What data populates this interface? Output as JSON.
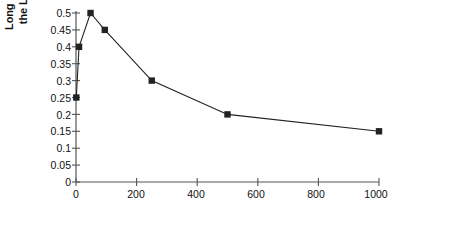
{
  "chart_data": {
    "type": "line",
    "title": "",
    "xlabel": "Average Agent Age",
    "ylabel": "Long Run Std. Deviation in the Log of Average Price",
    "ylabel_line1": "Long Run Std. Deviation in",
    "ylabel_line2": "the Log of Average Price",
    "x": [
      1,
      10,
      48,
      95,
      250,
      500,
      1000
    ],
    "values": [
      0.25,
      0.4,
      0.5,
      0.45,
      0.3,
      0.2,
      0.15
    ],
    "points": [
      {
        "x": 1,
        "y": 0.25
      },
      {
        "x": 10,
        "y": 0.4
      },
      {
        "x": 48,
        "y": 0.5
      },
      {
        "x": 95,
        "y": 0.45
      },
      {
        "x": 250,
        "y": 0.3
      },
      {
        "x": 500,
        "y": 0.2
      },
      {
        "x": 1000,
        "y": 0.15
      }
    ],
    "xlim": [
      0,
      1000
    ],
    "ylim": [
      0,
      0.5
    ],
    "xticks": [
      0,
      200,
      400,
      600,
      800,
      1000
    ],
    "xtick_labels": [
      "0",
      "200",
      "400",
      "600",
      "800",
      "1000"
    ],
    "yticks": [
      0,
      0.05,
      0.1,
      0.15,
      0.2,
      0.25,
      0.3,
      0.35,
      0.4,
      0.45,
      0.5
    ],
    "ytick_labels": [
      "0",
      "0.05",
      "0.1",
      "0.15",
      "0.2",
      "0.25",
      "0.3",
      "0.35",
      "0.4",
      "0.45",
      "0.5"
    ],
    "grid": false,
    "legend": null,
    "marker": "square",
    "series_color": "#222222",
    "axis_color": "#555555",
    "background": "#ffffff"
  }
}
